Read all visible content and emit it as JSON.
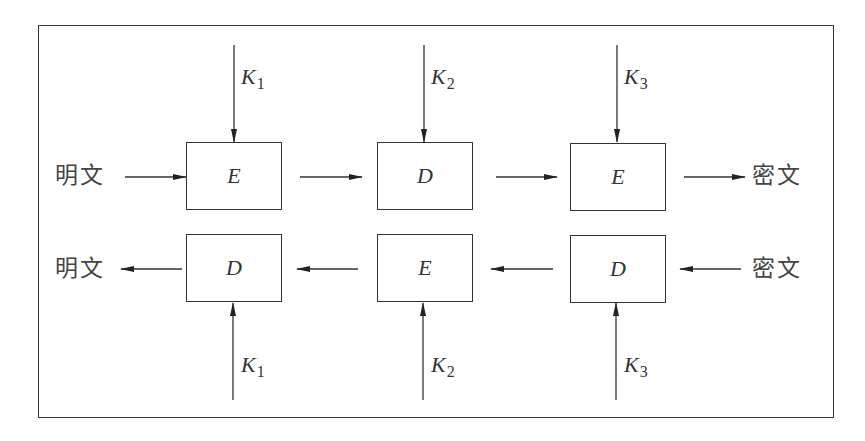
{
  "diagram": {
    "encrypt_row": {
      "input_label": "明文",
      "output_label": "密文",
      "stages": [
        {
          "op": "E",
          "key": "K",
          "key_index": "1"
        },
        {
          "op": "D",
          "key": "K",
          "key_index": "2"
        },
        {
          "op": "E",
          "key": "K",
          "key_index": "3"
        }
      ]
    },
    "decrypt_row": {
      "input_label": "密文",
      "output_label": "明文",
      "stages": [
        {
          "op": "D",
          "key": "K",
          "key_index": "1"
        },
        {
          "op": "E",
          "key": "K",
          "key_index": "2"
        },
        {
          "op": "D",
          "key": "K",
          "key_index": "3"
        }
      ]
    },
    "colors": {
      "line": "#333333",
      "text": "#444444",
      "background": "#ffffff"
    }
  }
}
